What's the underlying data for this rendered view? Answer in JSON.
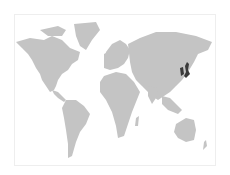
{
  "map": {
    "type": "world-choropleth",
    "projection": "miller",
    "land_color": "#c4c4c4",
    "highlight_color": "#3a3a3a",
    "background": "#ffffff",
    "border_color": "#eeeeee",
    "highlighted_regions": [
      "Japan",
      "Korea"
    ]
  }
}
